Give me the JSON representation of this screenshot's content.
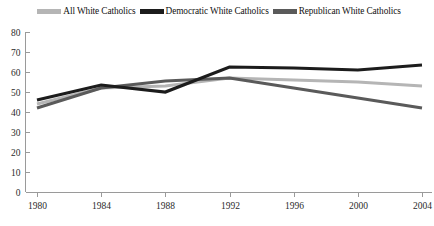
{
  "chart_data": {
    "type": "line",
    "title": "",
    "xlabel": "",
    "ylabel": "",
    "x": [
      1980,
      1984,
      1988,
      1992,
      1996,
      2000,
      2004
    ],
    "xtick_labels": [
      "1980",
      "1984",
      "1988",
      "1992",
      "1996",
      "2000",
      "2004"
    ],
    "ytick_labels": [
      "0",
      "10",
      "20",
      "30",
      "40",
      "50",
      "60",
      "70",
      "80"
    ],
    "yticks": [
      0,
      10,
      20,
      30,
      40,
      50,
      60,
      70,
      80
    ],
    "ylim": [
      0,
      80
    ],
    "xlim": [
      1980,
      2004
    ],
    "grid": false,
    "legend_position": "top",
    "series": [
      {
        "name": "All White Catholics",
        "color": "#b5b5b5",
        "values": [
          44,
          52,
          53,
          57,
          56,
          55,
          53
        ]
      },
      {
        "name": "Democratic White Catholics",
        "color": "#1c1c1c",
        "values": [
          46,
          53.5,
          50,
          62.5,
          62,
          61,
          63.5
        ]
      },
      {
        "name": "Republican White Catholics",
        "color": "#5a5a5a",
        "values": [
          42,
          52,
          55.5,
          57,
          52,
          47,
          42
        ]
      }
    ]
  },
  "legend": {
    "items": [
      {
        "label": "All White Catholics",
        "color": "#b5b5b5"
      },
      {
        "label": "Democratic White Catholics",
        "color": "#1c1c1c"
      },
      {
        "label": "Republican White Catholics",
        "color": "#5a5a5a"
      }
    ]
  }
}
